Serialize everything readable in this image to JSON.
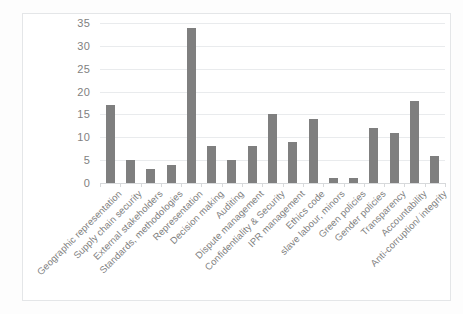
{
  "chart_data": {
    "type": "bar",
    "title": "",
    "subtitle": "",
    "xlabel": "",
    "ylabel": "",
    "ylim": [
      0,
      35
    ],
    "yticks": [
      0,
      5,
      10,
      15,
      20,
      25,
      30,
      35
    ],
    "grid": true,
    "legend": false,
    "legend_position": "none",
    "bar_color": "#7f7f7f",
    "gridline_color": "#e9ebed",
    "tick_label_color": "#7f7f7f",
    "categories": [
      "Geographic representation",
      "Supply chain security",
      "External stakeholders",
      "Standards, methodologies",
      "Representation",
      "Decision making",
      "Auditing",
      "Dispute management",
      "Confidentiality & Security",
      "IPR management",
      "Ethics code",
      "slave labour, minors",
      "Green policies",
      "Gender policies",
      "Transparency",
      "Accountability",
      "Anti-corruption/ integrity"
    ],
    "values": [
      17,
      5,
      3,
      4,
      34,
      8,
      5,
      8,
      15,
      9,
      14,
      1,
      1,
      12,
      11,
      18,
      6
    ]
  }
}
